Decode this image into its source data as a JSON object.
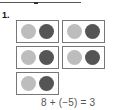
{
  "problem": {
    "number": "1.",
    "equation": "8 + (−5) = 3",
    "pairs": [
      {
        "left": "positive",
        "right": "negative"
      },
      {
        "left": "positive",
        "right": "negative"
      },
      {
        "left": "positive",
        "right": "negative"
      },
      {
        "left": "positive",
        "right": "negative"
      },
      {
        "left": "positive",
        "right": "negative"
      }
    ]
  },
  "colors": {
    "positive_chip": "#bdbdbd",
    "negative_chip": "#555555",
    "box_border": "#777777"
  }
}
